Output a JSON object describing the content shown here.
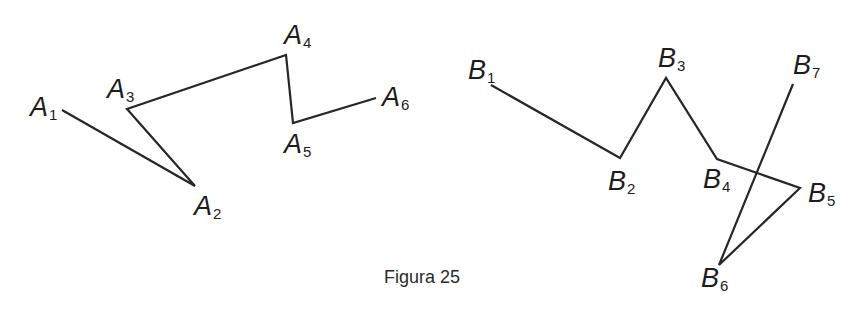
{
  "caption": "Figura 25",
  "stroke_color": "#262626",
  "polylines": [
    {
      "name": "A",
      "vertices": [
        {
          "letter": "A",
          "index": "1",
          "x": 62,
          "y": 110,
          "lx": 30,
          "ly": 94
        },
        {
          "letter": "A",
          "index": "2",
          "x": 195,
          "y": 186,
          "lx": 194,
          "ly": 193
        },
        {
          "letter": "A",
          "index": "3",
          "x": 127,
          "y": 109,
          "lx": 107,
          "ly": 76
        },
        {
          "letter": "A",
          "index": "4",
          "x": 286,
          "y": 55,
          "lx": 284,
          "ly": 22
        },
        {
          "letter": "A",
          "index": "5",
          "x": 293,
          "y": 123,
          "lx": 284,
          "ly": 131
        },
        {
          "letter": "A",
          "index": "6",
          "x": 376,
          "y": 98,
          "lx": 382,
          "ly": 84
        }
      ]
    },
    {
      "name": "B",
      "vertices": [
        {
          "letter": "B",
          "index": "1",
          "x": 491,
          "y": 85,
          "lx": 468,
          "ly": 57
        },
        {
          "letter": "B",
          "index": "2",
          "x": 620,
          "y": 158,
          "lx": 608,
          "ly": 168
        },
        {
          "letter": "B",
          "index": "3",
          "x": 666,
          "y": 78,
          "lx": 658,
          "ly": 45
        },
        {
          "letter": "B",
          "index": "4",
          "x": 717,
          "y": 159,
          "lx": 703,
          "ly": 166
        },
        {
          "letter": "B",
          "index": "5",
          "x": 800,
          "y": 188,
          "lx": 808,
          "ly": 180
        },
        {
          "letter": "B",
          "index": "6",
          "x": 719,
          "y": 265,
          "lx": 701,
          "ly": 265
        },
        {
          "letter": "B",
          "index": "7",
          "x": 793,
          "y": 84,
          "lx": 793,
          "ly": 52
        }
      ]
    }
  ]
}
